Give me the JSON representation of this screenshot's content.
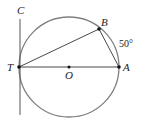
{
  "diagram": {
    "type": "circle-tangent-chord",
    "colors": {
      "circle": "#808080",
      "lines": "#333333",
      "points": "#111111"
    },
    "circle": {
      "center": "O",
      "cx": 69,
      "cy": 67,
      "r": 50
    },
    "points": [
      {
        "id": "T",
        "label": "T",
        "x": 19,
        "y": 67,
        "lx": 7,
        "ly": 71
      },
      {
        "id": "A",
        "label": "A",
        "x": 119,
        "y": 67,
        "lx": 123,
        "ly": 71
      },
      {
        "id": "O",
        "label": "O",
        "x": 69,
        "y": 67,
        "lx": 65,
        "ly": 79
      },
      {
        "id": "B",
        "label": "B",
        "x": 99,
        "y": 29,
        "lx": 100,
        "ly": 24
      },
      {
        "id": "C",
        "label": "C",
        "x": 20,
        "y": 15,
        "lx": 17,
        "ly": 14
      }
    ],
    "segments": [
      {
        "from": "T",
        "to": "A",
        "name": "diameter-TA"
      },
      {
        "from": "T",
        "to": "B",
        "name": "chord-TB"
      },
      {
        "from": "B",
        "to": "A",
        "name": "chord-BA"
      }
    ],
    "tangent_line": {
      "name": "tangent-TC",
      "x": 20,
      "y1": 19,
      "y2": 115
    },
    "arc_label": {
      "text": "50°",
      "x": 120,
      "y": 47
    }
  }
}
